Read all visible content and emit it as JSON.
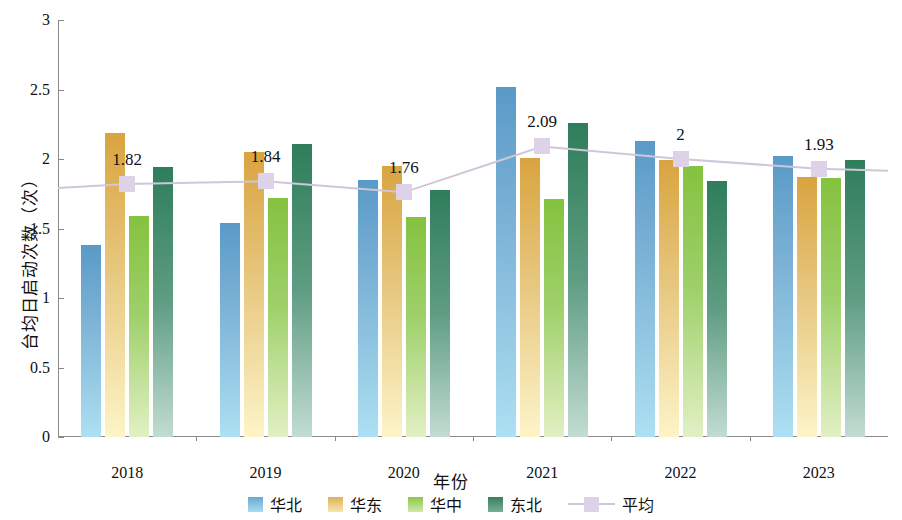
{
  "chart_data": {
    "type": "bar",
    "title": "",
    "xlabel": "年份",
    "ylabel": "台均日启动次数（次）",
    "categories": [
      "2018",
      "2019",
      "2020",
      "2021",
      "2022",
      "2023"
    ],
    "ylim": [
      0,
      3
    ],
    "yticks": [
      "0",
      "0.5",
      "1",
      "1.5",
      "2",
      "2.5",
      "3"
    ],
    "ytick_values": [
      0,
      0.5,
      1,
      1.5,
      2,
      2.5,
      3
    ],
    "grid": false,
    "legend_position": "bottom",
    "series": [
      {
        "name": "华北",
        "type": "bar",
        "color": "#6aa8d2",
        "values": [
          1.38,
          1.54,
          1.85,
          2.52,
          2.13,
          2.02
        ]
      },
      {
        "name": "华东",
        "type": "bar",
        "color": "#e0b055",
        "values": [
          2.19,
          2.05,
          1.95,
          2.01,
          1.99,
          1.87
        ]
      },
      {
        "name": "华中",
        "type": "bar",
        "color": "#8ec74a",
        "values": [
          1.59,
          1.72,
          1.58,
          1.71,
          1.95,
          1.86
        ]
      },
      {
        "name": "东北",
        "type": "bar",
        "color": "#35805f",
        "values": [
          1.94,
          2.11,
          1.78,
          2.26,
          1.84,
          1.99
        ]
      },
      {
        "name": "平均",
        "type": "line",
        "color": "#ded2e8",
        "values": [
          1.82,
          1.84,
          1.76,
          2.09,
          2.0,
          1.93
        ],
        "data_labels": [
          "1.82",
          "1.84",
          "1.76",
          "2.09",
          "2",
          "1.93"
        ]
      }
    ]
  },
  "legend": {
    "items": [
      {
        "label": "华北"
      },
      {
        "label": "华东"
      },
      {
        "label": "华中"
      },
      {
        "label": "东北"
      },
      {
        "label": "平均"
      }
    ]
  }
}
